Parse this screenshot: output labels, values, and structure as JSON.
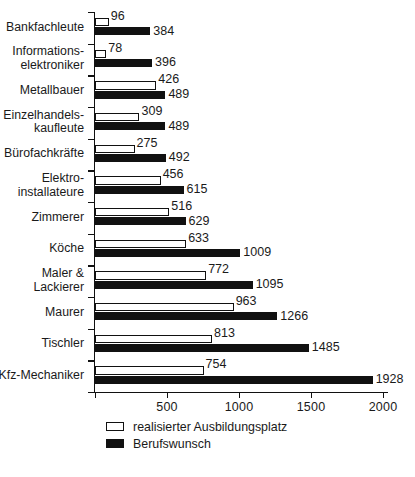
{
  "chart_data": {
    "type": "bar",
    "orientation": "horizontal",
    "title": "",
    "subtitle": "",
    "xlabel": "",
    "ylabel": "",
    "xlim": [
      0,
      2000
    ],
    "xticks": [
      0,
      500,
      1000,
      1500,
      2000
    ],
    "xticklabels": [
      "",
      "500",
      "1000",
      "1500",
      "2000"
    ],
    "grid": false,
    "legend_position": "bottom-left",
    "categories": [
      "Bankfachleute",
      "Informations-\nelektroniker",
      "Metallbauer",
      "Einzelhandels-\nkaufleute",
      "Bürofachkräfte",
      "Elektro-\ninstallateure",
      "Zimmerer",
      "Köche",
      "Maler &\nLackierer",
      "Maurer",
      "Tischler",
      "Kfz-Mechaniker"
    ],
    "series": [
      {
        "name": "realisierter Ausbildungsplatz",
        "style": "open",
        "color": "#ffffff",
        "edgecolor": "#111111",
        "values": [
          96,
          78,
          426,
          309,
          275,
          456,
          516,
          633,
          772,
          963,
          813,
          754
        ]
      },
      {
        "name": "Berufswunsch",
        "style": "filled",
        "color": "#111111",
        "edgecolor": "#111111",
        "values": [
          384,
          396,
          489,
          489,
          492,
          615,
          629,
          1009,
          1095,
          1266,
          1485,
          1928
        ]
      }
    ]
  },
  "legend": {
    "items": [
      {
        "label": "realisierter Ausbildungsplatz",
        "style": "open"
      },
      {
        "label": "Berufswunsch",
        "style": "solid"
      }
    ]
  }
}
